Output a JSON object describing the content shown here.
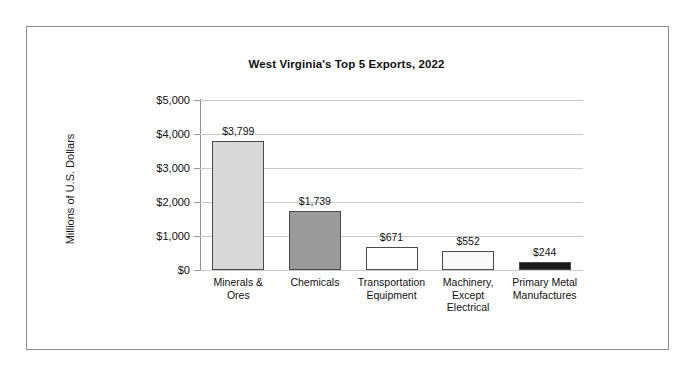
{
  "chart_data": {
    "type": "bar",
    "title": "West Virginia's Top 5 Exports, 2022",
    "xlabel": "",
    "ylabel": "Millions of U.S. Dollars",
    "ylim": [
      0,
      5000
    ],
    "ytick_labels": [
      "$5,000",
      "$4,000",
      "$3,000",
      "$2,000",
      "$1,000",
      "$0"
    ],
    "ytick_values": [
      5000,
      4000,
      3000,
      2000,
      1000,
      0
    ],
    "grid": true,
    "legend": "none",
    "categories": [
      "Minerals & Ores",
      "Chemicals",
      "Transportation Equipment",
      "Machinery, Except Electrical",
      "Primary Metal Manufactures"
    ],
    "category_lines": [
      [
        "Minerals &",
        "Ores"
      ],
      [
        "Chemicals"
      ],
      [
        "Transportation",
        "Equipment"
      ],
      [
        "Machinery,",
        "Except",
        "Electrical"
      ],
      [
        "Primary Metal",
        "Manufactures"
      ]
    ],
    "values": [
      3799,
      1739,
      671,
      552,
      244
    ],
    "value_labels": [
      "$3,799",
      "$1,739",
      "$671",
      "$552",
      "$244"
    ],
    "bar_colors": [
      "#d9d9d9",
      "#9a9a9a",
      "#ffffff",
      "#fafafa",
      "#1a1a1a"
    ],
    "bar_border_color": "#4a4a4a"
  },
  "style": {
    "page_background": "#ffffff",
    "frame_border": "#8c8c8c",
    "gridline_color": "#c9c9c9",
    "axis_color": "#8f8f8f",
    "text_color": "#111111"
  }
}
